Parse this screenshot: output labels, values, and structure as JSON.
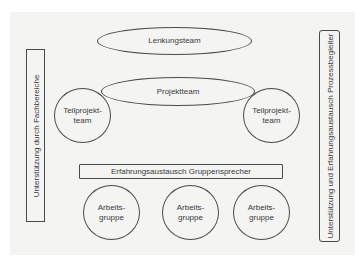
{
  "diagram": {
    "side_left": {
      "label": "Unterstützung durch Fachbereiche"
    },
    "side_right": {
      "label": "Unterstützung und Erfahrungsaustausch Prozessbegleiter"
    },
    "lenkungsteam": {
      "label": "Lenkungsteam"
    },
    "projektteam": {
      "label": "Projektteam"
    },
    "teilprojektteams": [
      {
        "line1": "Teilprojekt-",
        "line2": "team"
      },
      {
        "line1": "Teilprojekt-",
        "line2": "team"
      }
    ],
    "gruppensprecher": {
      "label": "Erfahrungsaustausch Gruppensprecher"
    },
    "arbeitsgruppen": [
      {
        "line1": "Arbeits-",
        "line2": "gruppe"
      },
      {
        "line1": "Arbeits-",
        "line2": "gruppe"
      },
      {
        "line1": "Arbeits-",
        "line2": "gruppe"
      }
    ]
  },
  "colors": {
    "panel_background": "#f4f4f3",
    "stroke": "#4a4a4a",
    "text": "#3a3a3a"
  }
}
